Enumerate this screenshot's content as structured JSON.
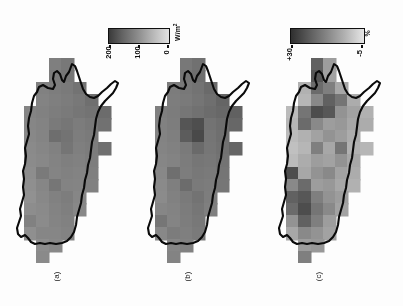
{
  "figure": {
    "orientation": "rotated-90",
    "background": "#ffffff",
    "panels": [
      {
        "id": "a",
        "letter": "(a)",
        "colorbar_ref": "wm2"
      },
      {
        "id": "b",
        "letter": "(b)",
        "colorbar_ref": "wm2"
      },
      {
        "id": "c",
        "letter": "(c)",
        "colorbar_ref": "pct"
      }
    ]
  },
  "colorbars": {
    "wm2": {
      "unit": "W/m",
      "unit_exp": "2",
      "ticks": [
        "200",
        "100",
        "0"
      ],
      "tick_positions_pct": [
        2,
        50,
        98
      ],
      "low_color": "#3a3a3a",
      "high_color": "#e2e2e2",
      "orientation": "horizontal-reversed"
    },
    "pct": {
      "unit": "%",
      "unit_exp": "",
      "ticks": [
        "+30",
        "-5"
      ],
      "tick_positions_pct": [
        2,
        96
      ],
      "low_color": "#2f2f2f",
      "high_color": "#e6e6e6",
      "orientation": "horizontal-reversed"
    }
  },
  "chart_data": {
    "type": "heatmap",
    "title": "",
    "subtitle": "",
    "xlabel": "",
    "ylabel": "",
    "grid": false,
    "legend_position": "top",
    "cols": 9,
    "rows": 17,
    "cell_px": 12.2,
    "panels": [
      {
        "name": "(a)",
        "unit": "W/m2",
        "vmin": 0,
        "vmax": 200,
        "values": [
          [
            null,
            null,
            null,
            120,
            128,
            null,
            null,
            null,
            null
          ],
          [
            null,
            null,
            null,
            124,
            130,
            null,
            null,
            null,
            null
          ],
          [
            null,
            null,
            118,
            122,
            126,
            134,
            null,
            null,
            null
          ],
          [
            null,
            null,
            116,
            120,
            124,
            128,
            138,
            null,
            null
          ],
          [
            null,
            114,
            118,
            122,
            126,
            130,
            134,
            142,
            null
          ],
          [
            null,
            112,
            116,
            126,
            130,
            124,
            128,
            136,
            null
          ],
          [
            null,
            110,
            114,
            140,
            134,
            122,
            126,
            null,
            null
          ],
          [
            null,
            108,
            112,
            118,
            132,
            120,
            124,
            138,
            null
          ],
          [
            null,
            106,
            110,
            116,
            120,
            118,
            122,
            null,
            null
          ],
          [
            null,
            104,
            126,
            114,
            118,
            116,
            120,
            null,
            null
          ],
          [
            null,
            102,
            112,
            130,
            116,
            114,
            118,
            null,
            null
          ],
          [
            null,
            100,
            110,
            118,
            122,
            112,
            null,
            null,
            null
          ],
          [
            null,
            104,
            108,
            116,
            120,
            110,
            null,
            null,
            null
          ],
          [
            null,
            118,
            106,
            114,
            118,
            null,
            null,
            null,
            null
          ],
          [
            null,
            102,
            112,
            112,
            116,
            null,
            null,
            null,
            null
          ],
          [
            null,
            null,
            104,
            110,
            null,
            null,
            null,
            null,
            null
          ],
          [
            null,
            null,
            108,
            null,
            null,
            null,
            null,
            null,
            null
          ]
        ]
      },
      {
        "name": "(b)",
        "unit": "W/m2",
        "vmin": 0,
        "vmax": 200,
        "values": [
          [
            null,
            null,
            null,
            128,
            136,
            null,
            null,
            null,
            null
          ],
          [
            null,
            null,
            null,
            132,
            140,
            null,
            null,
            null,
            null
          ],
          [
            null,
            null,
            124,
            128,
            134,
            144,
            null,
            null,
            null
          ],
          [
            null,
            null,
            122,
            126,
            132,
            138,
            150,
            null,
            null
          ],
          [
            null,
            120,
            124,
            130,
            136,
            142,
            146,
            154,
            null
          ],
          [
            null,
            118,
            122,
            168,
            176,
            134,
            140,
            148,
            null
          ],
          [
            null,
            116,
            120,
            160,
            182,
            132,
            138,
            null,
            null
          ],
          [
            null,
            114,
            118,
            126,
            144,
            130,
            136,
            150,
            null
          ],
          [
            null,
            112,
            116,
            124,
            130,
            128,
            134,
            null,
            null
          ],
          [
            null,
            110,
            138,
            122,
            128,
            126,
            132,
            null,
            null
          ],
          [
            null,
            108,
            120,
            142,
            126,
            124,
            130,
            null,
            null
          ],
          [
            null,
            106,
            118,
            126,
            134,
            122,
            null,
            null,
            null
          ],
          [
            null,
            112,
            116,
            124,
            130,
            120,
            null,
            null,
            null
          ],
          [
            null,
            130,
            114,
            122,
            128,
            null,
            null,
            null,
            null
          ],
          [
            null,
            110,
            124,
            120,
            126,
            null,
            null,
            null,
            null
          ],
          [
            null,
            null,
            112,
            118,
            null,
            null,
            null,
            null,
            null
          ],
          [
            null,
            null,
            116,
            null,
            null,
            null,
            null,
            null,
            null
          ]
        ]
      },
      {
        "name": "(c)",
        "unit": "%",
        "vmin": -5,
        "vmax": 30,
        "values": [
          [
            null,
            null,
            null,
            22,
            10,
            null,
            null,
            null,
            null
          ],
          [
            null,
            null,
            null,
            24,
            9,
            null,
            null,
            null,
            null
          ],
          [
            null,
            null,
            6,
            20,
            16,
            8,
            null,
            null,
            null
          ],
          [
            null,
            null,
            5,
            14,
            22,
            18,
            7,
            null,
            null
          ],
          [
            null,
            4,
            18,
            26,
            24,
            12,
            9,
            6,
            null
          ],
          [
            null,
            5,
            20,
            14,
            10,
            11,
            8,
            7,
            null
          ],
          [
            null,
            4,
            6,
            9,
            12,
            10,
            7,
            null,
            null
          ],
          [
            null,
            3,
            5,
            16,
            8,
            18,
            6,
            5,
            null
          ],
          [
            null,
            4,
            7,
            10,
            9,
            12,
            8,
            null,
            null
          ],
          [
            null,
            26,
            8,
            12,
            14,
            9,
            7,
            null,
            null
          ],
          [
            null,
            14,
            20,
            10,
            11,
            8,
            6,
            null,
            null
          ],
          [
            null,
            22,
            24,
            16,
            12,
            10,
            null,
            null,
            null
          ],
          [
            null,
            20,
            26,
            18,
            14,
            9,
            null,
            null,
            null
          ],
          [
            null,
            12,
            22,
            16,
            10,
            null,
            null,
            null,
            null
          ],
          [
            null,
            8,
            14,
            12,
            9,
            null,
            null,
            null,
            null
          ],
          [
            null,
            null,
            10,
            11,
            null,
            null,
            null,
            null,
            null
          ],
          [
            null,
            null,
            16,
            null,
            null,
            null,
            null,
            null,
            null
          ]
        ]
      }
    ]
  }
}
